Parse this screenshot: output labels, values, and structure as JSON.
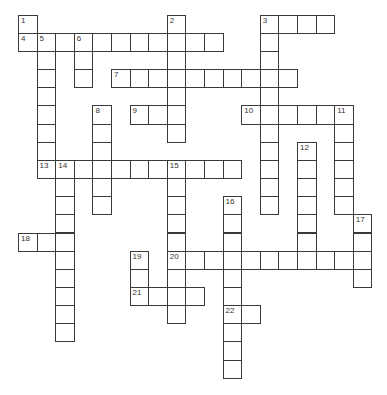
{
  "puzzle": {
    "type": "crossword",
    "grid_origin": {
      "x": 18,
      "y": 14.7
    },
    "cell_size": {
      "w": 18.6,
      "h": 18.15
    },
    "colors": {
      "line": "#3a3a3a",
      "cell_bg": "#ffffff",
      "number": "#333333",
      "page_bg": "#ffffff"
    },
    "words": [
      {
        "number": "1",
        "dir": "down",
        "row": 0,
        "col": 0,
        "length": 2
      },
      {
        "number": "2",
        "dir": "down",
        "row": 0,
        "col": 8,
        "length": 7
      },
      {
        "number": "3",
        "dir": "across",
        "row": 0,
        "col": 13,
        "length": 4
      },
      {
        "number": "3",
        "dir": "down",
        "row": 0,
        "col": 13,
        "length": 11
      },
      {
        "number": "4",
        "dir": "across",
        "row": 1,
        "col": 0,
        "length": 11
      },
      {
        "number": "5",
        "dir": "down",
        "row": 1,
        "col": 1,
        "length": 8
      },
      {
        "number": "6",
        "dir": "down",
        "row": 1,
        "col": 3,
        "length": 3
      },
      {
        "number": "7",
        "dir": "across",
        "row": 3,
        "col": 5,
        "length": 10
      },
      {
        "number": "8",
        "dir": "down",
        "row": 5,
        "col": 4,
        "length": 6
      },
      {
        "number": "9",
        "dir": "across",
        "row": 5,
        "col": 6,
        "length": 3
      },
      {
        "number": "10",
        "dir": "across",
        "row": 5,
        "col": 12,
        "length": 6
      },
      {
        "number": "11",
        "dir": "down",
        "row": 5,
        "col": 17,
        "length": 6
      },
      {
        "number": "12",
        "dir": "down",
        "row": 7,
        "col": 15,
        "length": 7
      },
      {
        "number": "13",
        "dir": "across",
        "row": 8,
        "col": 1,
        "length": 11
      },
      {
        "number": "14",
        "dir": "down",
        "row": 8,
        "col": 2,
        "length": 10
      },
      {
        "number": "15",
        "dir": "down",
        "row": 8,
        "col": 8,
        "length": 9
      },
      {
        "number": "16",
        "dir": "down",
        "row": 10,
        "col": 11,
        "length": 10
      },
      {
        "number": "17",
        "dir": "down",
        "row": 11,
        "col": 18,
        "length": 4
      },
      {
        "number": "18",
        "dir": "across",
        "row": 12,
        "col": 0,
        "length": 3
      },
      {
        "number": "19",
        "dir": "down",
        "row": 13,
        "col": 6,
        "length": 3
      },
      {
        "number": "20",
        "dir": "across",
        "row": 13,
        "col": 8,
        "length": 11
      },
      {
        "number": "21",
        "dir": "across",
        "row": 15,
        "col": 6,
        "length": 4
      },
      {
        "number": "22",
        "dir": "across",
        "row": 16,
        "col": 11,
        "length": 2
      }
    ]
  }
}
